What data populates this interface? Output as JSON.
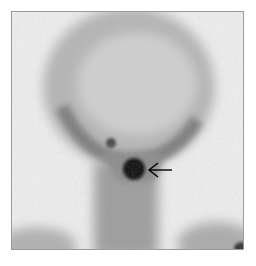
{
  "image": {
    "type": "scintigraphy",
    "description": "Grayscale nuclear medicine scan of head and neck (anterior view) with a focal dark uptake spot indicated by an arrow",
    "annotation": {
      "type": "arrow",
      "direction": "left",
      "target": "focal-uptake"
    },
    "colors": {
      "background": "#ececec",
      "soft_tissue": "#9a9a9a",
      "hot_spot": "#111111",
      "arrow": "#000000",
      "border": "#9a9a9a"
    }
  }
}
